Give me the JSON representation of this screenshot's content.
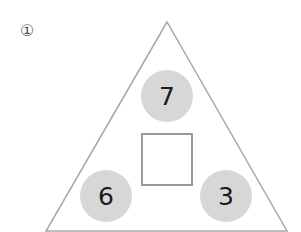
{
  "problem": {
    "label": "①",
    "top_number": "7",
    "bottom_left_number": "6",
    "bottom_right_number": "3",
    "answer_box_value": ""
  },
  "colors": {
    "triangle_stroke": "#a8a8a8",
    "circle_fill": "#d7d7d7",
    "box_stroke": "#999999"
  }
}
